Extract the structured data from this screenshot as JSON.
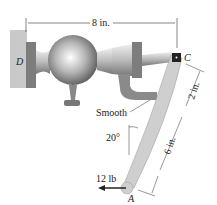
{
  "labels": {
    "dim_top": "8 in.",
    "dim_upper": "2 in.",
    "dim_lower": "6 in.",
    "smooth": "Smooth",
    "angle": "20°",
    "force": "12 lb",
    "point_a": "A",
    "point_b": "B",
    "point_c": "C",
    "point_d": "D"
  },
  "colors": {
    "wall": "#c9c9c9",
    "lever": "#cfcfcf",
    "bracket": "#8a8a8a",
    "nut": "#7d7d7d",
    "line": "#333333"
  }
}
